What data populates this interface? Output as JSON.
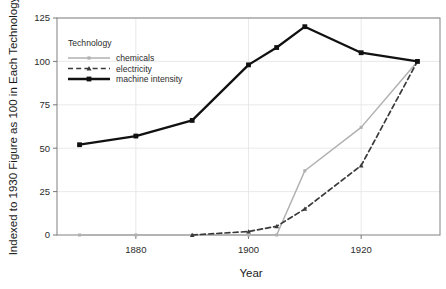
{
  "chart_data": {
    "type": "line",
    "title": "",
    "xlabel": "Year",
    "ylabel": "Indexed to 1930 Figure as 100 in Each Technology",
    "xlim": [
      1866,
      1934
    ],
    "ylim": [
      0,
      125
    ],
    "grid": true,
    "legend_title": "Technology",
    "legend_position": "top-left-inside",
    "xticks": [
      1880,
      1900,
      1920
    ],
    "xtick_labels": [
      "1880",
      "1900",
      "1920"
    ],
    "yticks": [
      0,
      25,
      50,
      75,
      100,
      125
    ],
    "ytick_labels": [
      "0",
      "25",
      "50",
      "75",
      "100",
      "125"
    ],
    "x": [
      1870,
      1880,
      1890,
      1900,
      1905,
      1910,
      1920,
      1930
    ],
    "series": [
      {
        "name": "chemicals",
        "color": "#b0b0b0",
        "style": "solid",
        "marker": "square",
        "values": [
          0,
          0,
          0,
          0,
          0,
          37,
          62,
          100
        ]
      },
      {
        "name": "electricity",
        "color": "#3a3a3a",
        "style": "dashed",
        "marker": "triangle",
        "values": [
          null,
          null,
          0,
          2,
          5,
          15,
          40,
          100
        ]
      },
      {
        "name": "machine intensity",
        "color": "#111111",
        "style": "solid",
        "marker": "square",
        "values": [
          52,
          57,
          66,
          98,
          108,
          120,
          105,
          100
        ]
      }
    ]
  },
  "legend": {
    "title": "Technology",
    "entries": [
      {
        "label": "chemicals"
      },
      {
        "label": "electricity"
      },
      {
        "label": "machine intensity"
      }
    ]
  },
  "axes": {
    "x_title": "Year",
    "y_title": "Indexed to 1930 Figure as 100 in Each Technology"
  }
}
